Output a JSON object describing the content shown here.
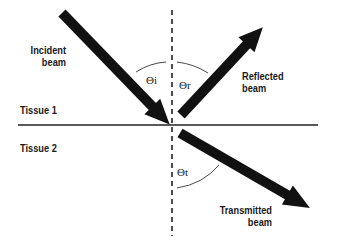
{
  "diagram": {
    "labels": {
      "incident_line1": "Incident",
      "incident_line2": "beam",
      "reflected_line1": "Reflected",
      "reflected_line2": "beam",
      "transmitted_line1": "Transmitted",
      "transmitted_line2": "beam",
      "tissue1": "Tissue 1",
      "tissue2": "Tissue 2"
    },
    "angles": {
      "incident": "Θi",
      "reflected": "Θr",
      "transmitted": "Θt"
    },
    "colors": {
      "arrow": "#111111",
      "line": "#222222",
      "background": "#ffffff"
    }
  }
}
